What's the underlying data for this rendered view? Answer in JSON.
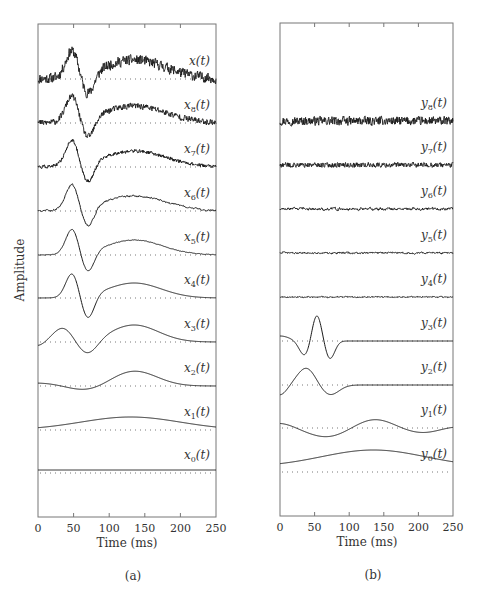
{
  "figure": {
    "ylabel": "Amplitude",
    "panel_a_caption": "(a)",
    "panel_b_caption": "(b)"
  },
  "chart_data": [
    {
      "type": "line",
      "panel": "(a)",
      "title": "",
      "xlabel": "Time (ms)",
      "ylabel": "Amplitude",
      "xlim": [
        0,
        250
      ],
      "xticks": [
        0,
        50,
        100,
        150,
        200,
        250
      ],
      "grid": false,
      "layout": "stacked traces with dotted zero baselines, labels at right",
      "series": [
        {
          "name": "x(t)",
          "label_main": "x",
          "sub": "",
          "baseline_y": 79,
          "noise": 5.0,
          "comps": [
            [
              48,
              9,
              26
            ],
            [
              70,
              9,
              -22
            ],
            [
              135,
              45,
              19
            ]
          ],
          "offset": 0
        },
        {
          "name": "x8(t)",
          "label_main": "x",
          "sub": "8",
          "baseline_y": 123,
          "noise": 3.0,
          "comps": [
            [
              48,
              9,
              25
            ],
            [
              70,
              9,
              -21
            ],
            [
              135,
              45,
              17
            ]
          ],
          "offset": 0
        },
        {
          "name": "x7(t)",
          "label_main": "x",
          "sub": "7",
          "baseline_y": 167,
          "noise": 1.6,
          "comps": [
            [
              48,
              9,
              25
            ],
            [
              70,
              9,
              -21
            ],
            [
              135,
              45,
              16
            ]
          ],
          "offset": 0
        },
        {
          "name": "x6(t)",
          "label_main": "x",
          "sub": "6",
          "baseline_y": 211,
          "noise": 0.9,
          "comps": [
            [
              48,
              9,
              25
            ],
            [
              70,
              9,
              -21
            ],
            [
              135,
              45,
              15
            ]
          ],
          "offset": 0
        },
        {
          "name": "x5(t)",
          "label_main": "x",
          "sub": "5",
          "baseline_y": 255,
          "noise": 0.3,
          "comps": [
            [
              48,
              9,
              25
            ],
            [
              70,
              9,
              -21
            ],
            [
              135,
              40,
              15
            ]
          ],
          "offset": 0
        },
        {
          "name": "x4(t)",
          "label_main": "x",
          "sub": "4",
          "baseline_y": 298,
          "noise": 0,
          "comps": [
            [
              48,
              9,
              24
            ],
            [
              70,
              9,
              -24
            ],
            [
              135,
              38,
              15
            ]
          ],
          "offset": 0
        },
        {
          "name": "x3(t)",
          "label_main": "x",
          "sub": "3",
          "baseline_y": 342,
          "noise": 0,
          "comps": [
            [
              35,
              14,
              14
            ],
            [
              70,
              14,
              -14
            ],
            [
              135,
              34,
              17
            ],
            [
              0,
              10,
              -4
            ]
          ],
          "offset": 0
        },
        {
          "name": "x2(t)",
          "label_main": "x",
          "sub": "2",
          "baseline_y": 386,
          "noise": 0,
          "comps": [
            [
              70,
              26,
              -5
            ],
            [
              135,
              32,
              15
            ],
            [
              0,
              30,
              3
            ]
          ],
          "offset": 0
        },
        {
          "name": "x1(t)",
          "label_main": "x",
          "sub": "1",
          "baseline_y": 430,
          "noise": 0,
          "comps": [
            [
              130,
              70,
              13
            ]
          ],
          "offset": 0
        },
        {
          "name": "x0(t)",
          "label_main": "x",
          "sub": "0",
          "baseline_y": 473,
          "noise": 0,
          "comps": [],
          "offset": 3
        }
      ]
    },
    {
      "type": "line",
      "panel": "(b)",
      "title": "",
      "xlabel": "Time (ms)",
      "ylabel": "",
      "xlim": [
        0,
        250
      ],
      "xticks": [
        0,
        50,
        100,
        150,
        200,
        250
      ],
      "grid": false,
      "layout": "stacked traces with dotted zero baselines, labels at right",
      "series": [
        {
          "name": "y8(t)",
          "label_main": "y",
          "sub": "8",
          "baseline_y": 121,
          "noise": 4.2,
          "comps": [],
          "offset": 0
        },
        {
          "name": "y7(t)",
          "label_main": "y",
          "sub": "7",
          "baseline_y": 165,
          "noise": 2.4,
          "comps": [],
          "offset": 0
        },
        {
          "name": "y6(t)",
          "label_main": "y",
          "sub": "6",
          "baseline_y": 209,
          "noise": 1.3,
          "comps": [],
          "offset": 0
        },
        {
          "name": "y5(t)",
          "label_main": "y",
          "sub": "5",
          "baseline_y": 253,
          "noise": 0.9,
          "comps": [],
          "offset": 0
        },
        {
          "name": "y4(t)",
          "label_main": "y",
          "sub": "4",
          "baseline_y": 297,
          "noise": 0.5,
          "comps": [],
          "offset": 0
        },
        {
          "name": "y3(t)",
          "label_main": "y",
          "sub": "3",
          "baseline_y": 341,
          "noise": 0,
          "comps": [
            [
              53,
              7,
              27
            ],
            [
              36,
              8,
              -15
            ],
            [
              72,
              7,
              -18
            ],
            [
              0,
              14,
              5
            ]
          ],
          "offset": 0
        },
        {
          "name": "y2(t)",
          "label_main": "y",
          "sub": "2",
          "baseline_y": 385,
          "noise": 0,
          "comps": [
            [
              38,
              13,
              17
            ],
            [
              72,
              13,
              -10
            ],
            [
              0,
              10,
              -10
            ]
          ],
          "offset": 0
        },
        {
          "name": "y1(t)",
          "label_main": "y",
          "sub": "1",
          "baseline_y": 428,
          "noise": 0,
          "comps": [
            [
              68,
              28,
              -9
            ],
            [
              137,
              27,
              9
            ],
            [
              205,
              28,
              -5
            ],
            [
              0,
              20,
              5
            ],
            [
              250,
              20,
              2
            ]
          ],
          "offset": 0
        },
        {
          "name": "y0(t)",
          "label_main": "y",
          "sub": "0",
          "baseline_y": 472,
          "noise": 0,
          "comps": [
            [
              135,
              75,
              17
            ]
          ],
          "offset": 5
        }
      ]
    }
  ]
}
